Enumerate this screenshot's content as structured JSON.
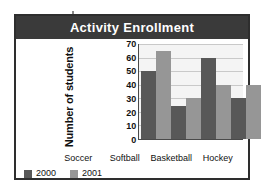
{
  "chart_data": {
    "type": "bar",
    "title": "Activity Enrollment",
    "xlabel": "",
    "ylabel": "Number of students",
    "categories": [
      "Soccer",
      "Softball",
      "Basketball",
      "Hockey"
    ],
    "series": [
      {
        "name": "2000",
        "color": "#585858",
        "values": [
          50,
          24,
          60,
          30
        ]
      },
      {
        "name": "2001",
        "color": "#969696",
        "values": [
          65,
          30,
          40,
          40
        ]
      }
    ],
    "ylim": [
      0,
      70
    ],
    "ytick_step": 10,
    "yticks": [
      70,
      60,
      50,
      40,
      30,
      20,
      10,
      0
    ],
    "grid": true,
    "legend_position": "bottom-left"
  },
  "legend": {
    "entries": [
      {
        "label": "2000",
        "swatch": "dark-gray-swatch"
      },
      {
        "label": "2001",
        "swatch": "light-gray-swatch"
      }
    ]
  },
  "colors": {
    "title_bar": "#3a3a3a",
    "title_text": "#ffffff",
    "plot_background": "#f4f4f4",
    "gridline": "#c9c9c9",
    "axis": "#4a4a4a",
    "frame_border": "#2e2e2e",
    "series_2000": "#585858",
    "series_2001": "#969696"
  }
}
